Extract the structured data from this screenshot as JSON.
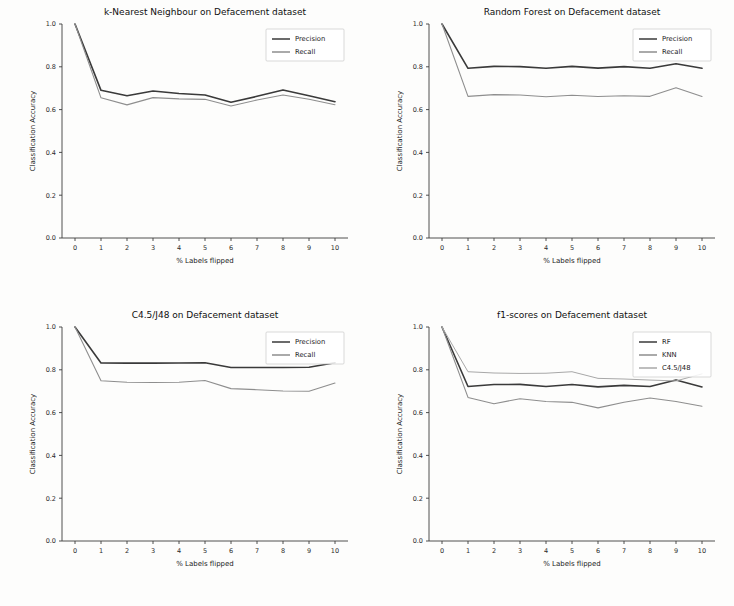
{
  "figure": {
    "background": "#fdfdfc",
    "layout": "2x2 grid of line charts",
    "axis_color": "#3c3c3c"
  },
  "common": {
    "xlabel": "% Labels flipped",
    "ylabel": "Classification Accuracy",
    "xticks": [
      "0",
      "1",
      "2",
      "3",
      "4",
      "5",
      "6",
      "7",
      "8",
      "9",
      "10"
    ],
    "yticks": [
      "0.0",
      "0.2",
      "0.4",
      "0.6",
      "0.8",
      "1.0"
    ]
  },
  "chart_data": [
    {
      "type": "line",
      "panel": "top-left",
      "title": "k-Nearest Neighbour on Defacement dataset",
      "xlabel": "% Labels flipped",
      "ylabel": "Classification Accuracy",
      "x": [
        0,
        1,
        2,
        3,
        4,
        5,
        6,
        7,
        8,
        9,
        10
      ],
      "xlim": [
        -0.5,
        10.5
      ],
      "ylim": [
        0.0,
        1.0
      ],
      "grid": false,
      "legend_position": "upper right",
      "series": [
        {
          "name": "Precision",
          "color": "#3a3a3a",
          "width": 1.6,
          "values": [
            1.0,
            0.69,
            0.665,
            0.687,
            0.675,
            0.668,
            0.634,
            0.662,
            0.692,
            0.665,
            0.637
          ]
        },
        {
          "name": "Recall",
          "color": "#8e8e8e",
          "width": 1.1,
          "values": [
            1.0,
            0.655,
            0.622,
            0.656,
            0.65,
            0.648,
            0.617,
            0.645,
            0.668,
            0.648,
            0.623
          ]
        }
      ]
    },
    {
      "type": "line",
      "panel": "top-right",
      "title": "Random Forest on Defacement dataset",
      "xlabel": "% Labels flipped",
      "ylabel": "Classification Accuracy",
      "x": [
        0,
        1,
        2,
        3,
        4,
        5,
        6,
        7,
        8,
        9,
        10
      ],
      "xlim": [
        -0.5,
        10.5
      ],
      "ylim": [
        0.0,
        1.0
      ],
      "grid": false,
      "legend_position": "upper right",
      "series": [
        {
          "name": "Precision",
          "color": "#3a3a3a",
          "width": 1.6,
          "values": [
            1.0,
            0.793,
            0.802,
            0.801,
            0.793,
            0.802,
            0.794,
            0.801,
            0.793,
            0.814,
            0.793
          ]
        },
        {
          "name": "Recall",
          "color": "#8e8e8e",
          "width": 1.1,
          "values": [
            1.0,
            0.662,
            0.67,
            0.668,
            0.66,
            0.667,
            0.661,
            0.665,
            0.662,
            0.702,
            0.661
          ]
        }
      ]
    },
    {
      "type": "line",
      "panel": "bottom-left",
      "title": "C4.5/J48 on Defacement dataset",
      "xlabel": "% Labels flipped",
      "ylabel": "Classification Accuracy",
      "x": [
        0,
        1,
        2,
        3,
        4,
        5,
        6,
        7,
        8,
        9,
        10
      ],
      "xlim": [
        -0.5,
        10.5
      ],
      "ylim": [
        0.0,
        1.0
      ],
      "grid": false,
      "legend_position": "upper right",
      "series": [
        {
          "name": "Precision",
          "color": "#3a3a3a",
          "width": 1.6,
          "values": [
            1.0,
            0.832,
            0.831,
            0.831,
            0.832,
            0.833,
            0.811,
            0.811,
            0.811,
            0.812,
            0.833
          ]
        },
        {
          "name": "Recall",
          "color": "#8e8e8e",
          "width": 1.1,
          "values": [
            1.0,
            0.749,
            0.742,
            0.741,
            0.742,
            0.75,
            0.712,
            0.707,
            0.701,
            0.7,
            0.738
          ]
        }
      ]
    },
    {
      "type": "line",
      "panel": "bottom-right",
      "title": "f1-scores on Defacement dataset",
      "xlabel": "% Labels flipped",
      "ylabel": "Classification Accuracy",
      "x": [
        0,
        1,
        2,
        3,
        4,
        5,
        6,
        7,
        8,
        9,
        10
      ],
      "xlim": [
        -0.5,
        10.5
      ],
      "ylim": [
        0.0,
        1.0
      ],
      "grid": false,
      "legend_position": "upper right",
      "series": [
        {
          "name": "RF",
          "color": "#3a3a3a",
          "width": 1.6,
          "values": [
            1.0,
            0.722,
            0.731,
            0.732,
            0.722,
            0.731,
            0.72,
            0.727,
            0.722,
            0.752,
            0.72
          ]
        },
        {
          "name": "KNN",
          "color": "#8e8e8e",
          "width": 1.1,
          "values": [
            1.0,
            0.671,
            0.641,
            0.665,
            0.652,
            0.648,
            0.622,
            0.648,
            0.668,
            0.652,
            0.63
          ]
        },
        {
          "name": "C4.5/J48",
          "color": "#a8a8a8",
          "width": 1.0,
          "values": [
            1.0,
            0.791,
            0.785,
            0.783,
            0.784,
            0.791,
            0.76,
            0.757,
            0.752,
            0.748,
            0.781
          ]
        }
      ]
    }
  ]
}
